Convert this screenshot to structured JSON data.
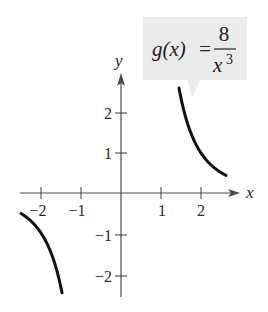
{
  "chart_data": {
    "type": "line",
    "title": "",
    "function_label": {
      "lhs": "g(x)",
      "equals": "=",
      "numerator": "8",
      "denominator_base": "x",
      "denominator_exp": "3"
    },
    "xlabel": "x",
    "ylabel": "y",
    "xlim": [
      -2.5,
      3
    ],
    "ylim": [
      -2.6,
      2.9
    ],
    "x_ticks": [
      -2,
      -1,
      1,
      2
    ],
    "x_tick_labels": [
      "−2",
      "−1",
      "1",
      "2"
    ],
    "y_ticks": [
      -2,
      -1,
      1,
      2
    ],
    "y_tick_labels": [
      "−2",
      "−1",
      "1",
      "2"
    ],
    "grid": false,
    "series": [
      {
        "name": "g(x) = 8/x^3 (x > 0)",
        "x": [
          1.45,
          1.6,
          1.8,
          2.0,
          2.2,
          2.4,
          2.625
        ],
        "y": [
          2.62,
          1.95,
          1.37,
          1.0,
          0.75,
          0.58,
          0.44
        ]
      },
      {
        "name": "g(x) = 8/x^3 (x < 0)",
        "x": [
          -2.5,
          -2.2,
          -2.0,
          -1.8,
          -1.6,
          -1.475
        ],
        "y": [
          -0.51,
          -0.75,
          -1.0,
          -1.37,
          -1.95,
          -2.49
        ]
      }
    ]
  },
  "labels": {
    "x_axis": "x",
    "y_axis": "y",
    "xt_m2": "−2",
    "xt_m1": "−1",
    "xt_1": "1",
    "xt_2": "2",
    "yt_2": "2",
    "yt_1": "1",
    "yt_m1": "−1",
    "yt_m2": "−2",
    "f_lhs": "g(x)",
    "f_eq": "=",
    "f_num": "8",
    "f_den": "x",
    "f_exp": "3"
  },
  "colors": {
    "callout_bg": "#ebebeb",
    "curve": "#111111",
    "axis": "#4a4a4a"
  }
}
